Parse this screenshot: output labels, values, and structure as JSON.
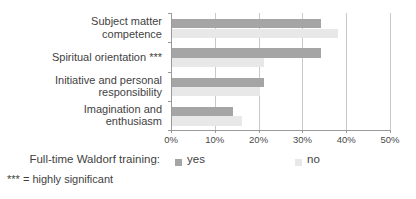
{
  "chart_data": {
    "type": "bar",
    "orientation": "horizontal",
    "title": "",
    "xlabel": "",
    "ylabel": "",
    "xlim": [
      0,
      50
    ],
    "x_ticks": [
      "0%",
      "10%",
      "20%",
      "30%",
      "40%",
      "50%"
    ],
    "grid": true,
    "legend_position": "bottom",
    "categories": [
      "Subject matter competence",
      "Spiritual orientation ***",
      "Initiative and personal responsibility",
      "Imagination and enthusiasm"
    ],
    "category_label_lines": [
      [
        "Subject matter",
        "competence"
      ],
      [
        "Spiritual orientation ***"
      ],
      [
        "Initiative and personal",
        "responsibility"
      ],
      [
        "Imagination and",
        "enthusiasm"
      ]
    ],
    "series": [
      {
        "name": "yes",
        "color": "#a5a5a5",
        "values": [
          34,
          34,
          21,
          14
        ]
      },
      {
        "name": "no",
        "color": "#e9e8e8",
        "values": [
          38,
          21,
          20,
          16
        ]
      }
    ]
  },
  "legend": {
    "prefix": "Full-time Waldorf training:",
    "items": [
      {
        "label": "yes",
        "color": "#a5a5a5"
      },
      {
        "label": "no",
        "color": "#e9e8e8"
      }
    ]
  },
  "footnote": "*** = highly significant",
  "colors": {
    "axis": "#9a9a9a",
    "gridline": "#c9c9c9",
    "text": "#3f3f3f",
    "background": "#ffffff"
  }
}
